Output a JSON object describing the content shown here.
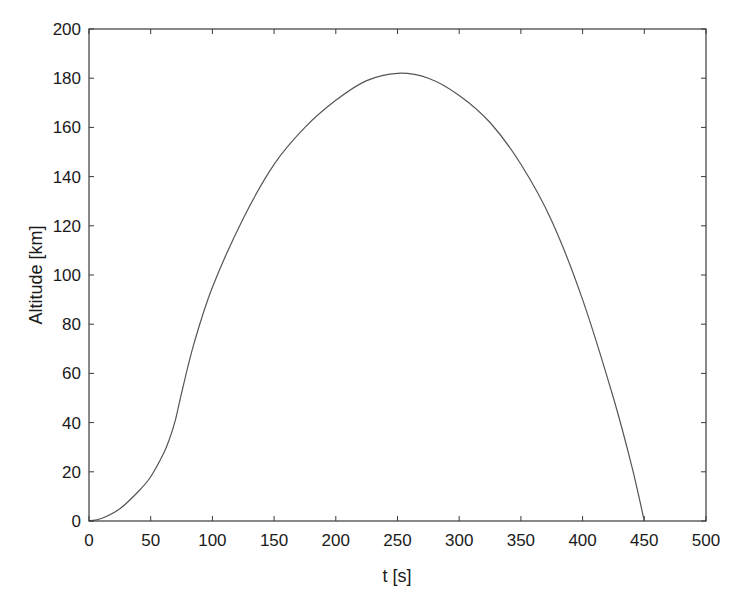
{
  "chart_data": {
    "type": "line",
    "title": "",
    "xlabel": "t [s]",
    "ylabel": "Altitude [km]",
    "xlim": [
      0,
      500
    ],
    "ylim": [
      0,
      200
    ],
    "xticks": [
      0,
      50,
      100,
      150,
      200,
      250,
      300,
      350,
      400,
      450,
      500
    ],
    "yticks": [
      0,
      20,
      40,
      60,
      80,
      100,
      120,
      140,
      160,
      180,
      200
    ],
    "grid": false,
    "legend": null,
    "series": [
      {
        "name": "Altitude",
        "color": "#555555",
        "x": [
          0,
          10,
          25,
          40,
          50,
          60,
          65,
          70,
          75,
          85,
          100,
          125,
          150,
          175,
          200,
          225,
          250,
          275,
          300,
          325,
          350,
          375,
          400,
          425,
          440,
          450
        ],
        "y": [
          0,
          1,
          5,
          12,
          18,
          27,
          33,
          41,
          52,
          72,
          95,
          123,
          145,
          160,
          171,
          179,
          182,
          180,
          173,
          162,
          145,
          122,
          90,
          50,
          22,
          0
        ]
      }
    ]
  },
  "colors": {
    "axis": "#3a3a3a",
    "line": "#555555",
    "background": "#ffffff"
  }
}
